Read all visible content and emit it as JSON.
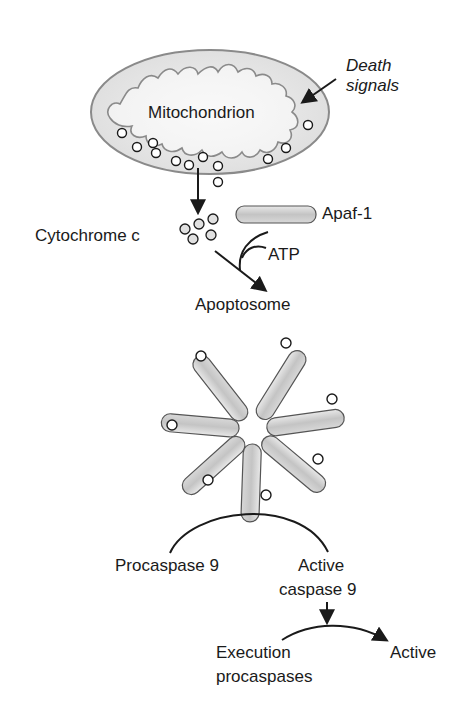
{
  "diagram": {
    "type": "pathway",
    "labels": {
      "mitochondrion": "Mitochondrion",
      "death_signals_line1": "Death",
      "death_signals_line2": "signals",
      "cytochrome_c": "Cytochrome c",
      "apaf1": "Apaf-1",
      "atp": "ATP",
      "apoptosome": "Apoptosome",
      "procaspase9": "Procaspase 9",
      "active_caspase9_line1": "Active",
      "active_caspase9_line2": "caspase 9",
      "execution_procaspases_line1": "Execution",
      "execution_procaspases_line2": "procaspases",
      "active": "Active"
    },
    "nodes": [
      {
        "id": "death_signals",
        "label": "Death signals"
      },
      {
        "id": "mitochondrion",
        "label": "Mitochondrion"
      },
      {
        "id": "cytochrome_c",
        "label": "Cytochrome c"
      },
      {
        "id": "apaf1",
        "label": "Apaf-1"
      },
      {
        "id": "atp",
        "label": "ATP"
      },
      {
        "id": "apoptosome",
        "label": "Apoptosome",
        "subunits": 7
      },
      {
        "id": "procaspase9",
        "label": "Procaspase 9"
      },
      {
        "id": "active_caspase9",
        "label": "Active caspase 9"
      },
      {
        "id": "execution_procaspases",
        "label": "Execution procaspases"
      },
      {
        "id": "active",
        "label": "Active"
      }
    ],
    "edges": [
      {
        "from": "death_signals",
        "to": "mitochondrion"
      },
      {
        "from": "mitochondrion",
        "to": "cytochrome_c"
      },
      {
        "from": "cytochrome_c",
        "to": "apoptosome",
        "with": [
          "apaf1",
          "atp"
        ]
      },
      {
        "from": "procaspase9",
        "to": "active_caspase9",
        "via": "apoptosome"
      },
      {
        "from": "execution_procaspases",
        "to": "active",
        "via": "active_caspase9"
      }
    ],
    "colors": {
      "stroke": "#1a1a1a",
      "membrane": "#8a8a8a",
      "fill_light": "#e6e6e6",
      "rod_fill": "#c8c8c8"
    }
  }
}
